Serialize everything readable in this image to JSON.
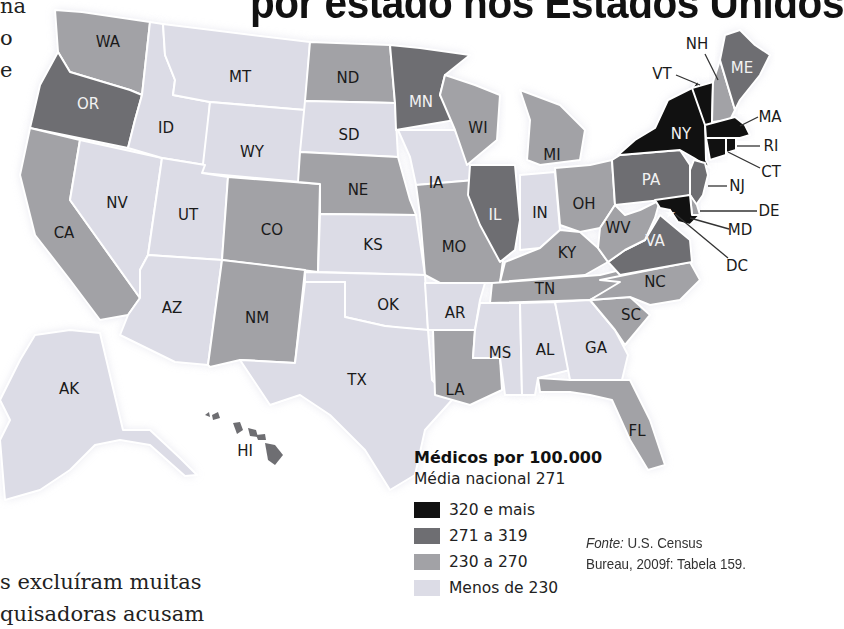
{
  "title": "por estado nos Estados Unidos",
  "side_text": {
    "top_fragments": [
      "na",
      "o",
      "e"
    ],
    "bottom_lines": [
      "s excluíram muitas",
      "quisadoras acusam"
    ]
  },
  "colors": {
    "cat_320_plus": "#111111",
    "cat_271_319": "#6e6e72",
    "cat_230_270": "#a2a2a6",
    "cat_below_230": "#dcdce6",
    "border": "#ffffff"
  },
  "legend": {
    "title": "Médicos por 100.000",
    "subtitle": "Média nacional 271",
    "items": [
      {
        "label": "320 e mais",
        "category": "cat_320_plus",
        "color": "#111111"
      },
      {
        "label": "271 a 319",
        "category": "cat_271_319",
        "color": "#6e6e72"
      },
      {
        "label": "230 a 270",
        "category": "cat_230_270",
        "color": "#a2a2a6"
      },
      {
        "label": "Menos de 230",
        "category": "cat_below_230",
        "color": "#dcdce6"
      }
    ]
  },
  "source": {
    "prefix": "Fonte:",
    "line1": " U.S. Census",
    "line2": "Bureau, 2009f: Tabela 159."
  },
  "chart_data": {
    "type": "choropleth",
    "national_average": 271,
    "bins": [
      "320 e mais",
      "271 a 319",
      "230 a 270",
      "Menos de 230"
    ],
    "states": {
      "WA": "230 a 270",
      "OR": "271 a 319",
      "CA": "230 a 270",
      "NV": "Menos de 230",
      "ID": "Menos de 230",
      "MT": "Menos de 230",
      "WY": "Menos de 230",
      "UT": "Menos de 230",
      "AZ": "Menos de 230",
      "CO": "230 a 270",
      "NM": "230 a 270",
      "ND": "230 a 270",
      "SD": "Menos de 230",
      "NE": "230 a 270",
      "KS": "Menos de 230",
      "OK": "Menos de 230",
      "TX": "Menos de 230",
      "MN": "271 a 319",
      "IA": "Menos de 230",
      "MO": "230 a 270",
      "AR": "Menos de 230",
      "LA": "230 a 270",
      "WI": "230 a 270",
      "IL": "271 a 319",
      "MI": "230 a 270",
      "IN": "Menos de 230",
      "OH": "230 a 270",
      "KY": "230 a 270",
      "TN": "230 a 270",
      "MS": "Menos de 230",
      "AL": "Menos de 230",
      "GA": "Menos de 230",
      "FL": "230 a 270",
      "SC": "230 a 270",
      "NC": "230 a 270",
      "VA": "271 a 319",
      "WV": "230 a 270",
      "PA": "271 a 319",
      "NY": "320 e mais",
      "VT": "320 e mais",
      "NH": "230 a 270",
      "ME": "271 a 319",
      "MA": "320 e mais",
      "RI": "320 e mais",
      "CT": "320 e mais",
      "NJ": "271 a 319",
      "DE": "230 a 270",
      "MD": "320 e mais",
      "DC": "320 e mais",
      "AK": "Menos de 230",
      "HI": "271 a 319"
    }
  },
  "states": [
    {
      "code": "WA",
      "cat": "cat_230_270",
      "pts": "55,10 82,12 150,22 142,95 130,90 70,72 58,52",
      "lx": 108,
      "ly": 42,
      "inv": false
    },
    {
      "code": "OR",
      "cat": "cat_271_319",
      "pts": "58,52 70,72 130,90 142,95 135,120 128,148 30,128 40,85",
      "lx": 88,
      "ly": 104,
      "inv": true
    },
    {
      "code": "CA",
      "cat": "cat_230_270",
      "pts": "30,128 80,140 70,200 140,298 128,315 100,320 70,280 35,235 20,175",
      "lx": 64,
      "ly": 233,
      "inv": false
    },
    {
      "code": "NV",
      "cat": "cat_below_230",
      "pts": "80,140 162,158 148,255 140,270 140,298 70,200",
      "lx": 117,
      "ly": 203,
      "inv": false
    },
    {
      "code": "ID",
      "cat": "cat_below_230",
      "pts": "150,22 163,24 165,55 175,80 173,95 210,102 205,165 162,158 128,148 135,120 142,95",
      "lx": 166,
      "ly": 128,
      "inv": false
    },
    {
      "code": "MT",
      "cat": "cat_below_230",
      "pts": "163,24 310,42 305,110 210,102 173,95 175,80 165,55",
      "lx": 240,
      "ly": 77,
      "inv": false
    },
    {
      "code": "WY",
      "cat": "cat_below_230",
      "pts": "210,102 305,110 300,182 202,173",
      "lx": 252,
      "ly": 152,
      "inv": false
    },
    {
      "code": "UT",
      "cat": "cat_below_230",
      "pts": "162,158 205,165 202,173 228,177 222,260 148,255",
      "lx": 188,
      "ly": 215,
      "inv": false
    },
    {
      "code": "AZ",
      "cat": "cat_below_230",
      "pts": "148,255 222,260 208,365 175,362 120,335 128,315 140,298 140,270",
      "lx": 172,
      "ly": 308,
      "inv": false
    },
    {
      "code": "CO",
      "cat": "cat_230_270",
      "pts": "228,177 320,184 318,272 222,260",
      "lx": 272,
      "ly": 230,
      "inv": false
    },
    {
      "code": "NM",
      "cat": "cat_230_270",
      "pts": "222,260 305,270 295,363 240,360 210,367 208,365",
      "lx": 257,
      "ly": 318,
      "inv": false
    },
    {
      "code": "ND",
      "cat": "cat_230_270",
      "pts": "310,42 390,45 395,103 305,101",
      "lx": 348,
      "ly": 78,
      "inv": false
    },
    {
      "code": "SD",
      "cat": "cat_below_230",
      "pts": "305,101 395,103 398,157 300,152",
      "lx": 349,
      "ly": 135,
      "inv": false
    },
    {
      "code": "NE",
      "cat": "cat_230_270",
      "pts": "300,152 398,157 410,200 416,215 320,214 320,184 298,182",
      "lx": 358,
      "ly": 190,
      "inv": false
    },
    {
      "code": "KS",
      "cat": "cat_below_230",
      "pts": "320,214 416,215 425,275 318,272",
      "lx": 373,
      "ly": 245,
      "inv": false
    },
    {
      "code": "OK",
      "cat": "cat_below_230",
      "pts": "305,272 425,275 428,330 400,328 385,326 345,317 345,282 305,282",
      "lx": 388,
      "ly": 305,
      "inv": false
    },
    {
      "code": "TX",
      "cat": "cat_below_230",
      "pts": "305,282 345,282 345,317 385,326 428,330 432,380 452,400 425,430 415,475 390,490 365,450 330,415 300,395 270,405 240,360 295,363",
      "lx": 357,
      "ly": 380,
      "inv": false
    },
    {
      "code": "MN",
      "cat": "cat_271_319",
      "pts": "390,45 420,48 470,55 445,75 440,95 455,120 396,130 395,103",
      "lx": 421,
      "ly": 102,
      "inv": true
    },
    {
      "code": "IA",
      "cat": "cat_below_230",
      "pts": "398,130 455,130 468,160 475,180 416,185 410,157",
      "lx": 436,
      "ly": 183,
      "inv": false
    },
    {
      "code": "MO",
      "cat": "cat_230_270",
      "pts": "416,185 475,180 485,215 505,245 500,283 440,283 425,275 420,215",
      "lx": 454,
      "ly": 247,
      "inv": false
    },
    {
      "code": "AR",
      "cat": "cat_below_230",
      "pts": "425,283 485,283 480,300 475,330 433,330 428,330",
      "lx": 455,
      "ly": 313,
      "inv": false
    },
    {
      "code": "LA",
      "cat": "cat_230_270",
      "pts": "433,330 475,330 473,358 500,358 502,390 470,405 435,395",
      "lx": 455,
      "ly": 390,
      "inv": false
    },
    {
      "code": "WI",
      "cat": "cat_230_270",
      "pts": "445,75 475,85 500,95 497,140 467,165 455,130 440,95",
      "lx": 478,
      "ly": 128,
      "inv": false
    },
    {
      "code": "IL",
      "cat": "cat_271_319",
      "pts": "470,165 515,165 520,220 515,250 500,262 480,225 468,195",
      "lx": 495,
      "ly": 215,
      "inv": true
    },
    {
      "code": "MI",
      "cat": "cat_230_270",
      "pts": "520,90 560,105 585,130 580,160 540,165 527,160 530,120",
      "lx": 552,
      "ly": 155,
      "inv": false
    },
    {
      "code": "IN",
      "cat": "cat_below_230",
      "pts": "520,175 555,172 560,230 540,248 520,250",
      "lx": 540,
      "ly": 213,
      "inv": false
    },
    {
      "code": "OH",
      "cat": "cat_230_270",
      "pts": "555,168 590,165 612,160 615,205 600,228 580,232 560,225",
      "lx": 584,
      "ly": 204,
      "inv": false
    },
    {
      "code": "KY",
      "cat": "cat_230_270",
      "pts": "505,262 540,248 560,230 580,232 598,248 608,262 585,275 500,282",
      "lx": 567,
      "ly": 253,
      "inv": false
    },
    {
      "code": "TN",
      "cat": "cat_230_270",
      "pts": "492,283 600,275 620,270 625,282 590,300 490,303",
      "lx": 545,
      "ly": 289,
      "inv": false
    },
    {
      "code": "MS",
      "cat": "cat_below_230",
      "pts": "480,303 520,303 522,395 505,395 500,358 473,358 475,330",
      "lx": 500,
      "ly": 353,
      "inv": false
    },
    {
      "code": "AL",
      "cat": "cat_below_230",
      "pts": "520,303 555,302 570,370 538,378 535,395 522,395",
      "lx": 545,
      "ly": 350,
      "inv": false
    },
    {
      "code": "GA",
      "cat": "cat_below_230",
      "pts": "555,302 590,300 615,330 628,355 622,380 570,380",
      "lx": 596,
      "ly": 348,
      "inv": false
    },
    {
      "code": "FL",
      "cat": "cat_230_270",
      "pts": "538,378 570,380 622,380 630,380 650,420 665,465 648,470 630,440 612,400 590,395 570,392 540,392",
      "lx": 637,
      "ly": 431,
      "inv": false
    },
    {
      "code": "SC",
      "cat": "cat_230_270",
      "pts": "590,300 630,297 650,315 625,345 615,330",
      "lx": 631,
      "ly": 315,
      "inv": false
    },
    {
      "code": "NC",
      "cat": "cat_230_270",
      "pts": "600,280 690,262 700,280 680,300 650,305 630,297 590,300 620,282",
      "lx": 655,
      "ly": 282,
      "inv": false
    },
    {
      "code": "VA",
      "cat": "cat_271_319",
      "pts": "608,262 625,250 645,240 660,215 678,230 690,240 692,262 620,275",
      "lx": 655,
      "ly": 241,
      "inv": true
    },
    {
      "code": "WV",
      "cat": "cat_230_270",
      "pts": "598,248 600,228 615,205 625,215 640,210 660,200 655,218 645,240 625,250 608,262",
      "lx": 618,
      "ly": 228,
      "inv": false
    },
    {
      "code": "PA",
      "cat": "cat_271_319",
      "pts": "612,160 620,155 680,150 690,165 690,195 680,198 615,205",
      "lx": 651,
      "ly": 180,
      "inv": true
    },
    {
      "code": "NY",
      "cat": "cat_320_plus",
      "pts": "618,155 635,140 655,128 668,100 692,88 698,80 705,120 706,160 710,168 694,158 680,150 620,155",
      "lx": 681,
      "ly": 134,
      "inv": true
    },
    {
      "code": "VT",
      "cat": "cat_320_plus",
      "pts": "692,88 713,82 712,125 705,125",
      "lx": 706,
      "ly": 105,
      "inv": false
    },
    {
      "code": "NH",
      "cat": "cat_230_270",
      "pts": "713,82 720,60 735,110 730,120 712,122",
      "lx": 722,
      "ly": 100,
      "inv": false
    },
    {
      "code": "ME",
      "cat": "cat_271_319",
      "pts": "720,60 725,35 740,30 755,45 770,55 760,75 740,100 735,110",
      "lx": 742,
      "ly": 68,
      "inv": true
    },
    {
      "code": "MA",
      "cat": "cat_320_plus",
      "pts": "705,125 735,117 745,125 750,135 740,138 706,138",
      "lx": 725,
      "ly": 130,
      "inv": false
    },
    {
      "code": "CT",
      "cat": "cat_320_plus",
      "pts": "706,138 726,138 726,155 710,160",
      "lx": 716,
      "ly": 148,
      "inv": false
    },
    {
      "code": "RI",
      "cat": "cat_320_plus",
      "pts": "726,138 736,138 736,150 726,153",
      "lx": 731,
      "ly": 145,
      "inv": false
    },
    {
      "code": "NJ",
      "cat": "cat_271_319",
      "pts": "694,160 705,163 708,175 703,195 696,205 690,195 690,170",
      "lx": 699,
      "ly": 182,
      "inv": false
    },
    {
      "code": "DE",
      "cat": "cat_230_270",
      "pts": "690,195 697,205 700,215 692,215",
      "lx": 694,
      "ly": 207,
      "inv": false
    },
    {
      "code": "MD",
      "cat": "cat_320_plus",
      "pts": "655,200 690,195 692,215 700,215 690,225 678,222 670,210 660,208",
      "lx": 680,
      "ly": 209,
      "inv": false
    },
    {
      "code": "AK",
      "cat": "cat_below_230",
      "pts": "35,335 70,330 100,333 123,430 150,430 180,458 197,475 185,476 150,445 120,440 95,445 70,470 40,490 5,500 0,440 10,420 0,400 20,360",
      "lx": 69,
      "ly": 389,
      "inv": false
    }
  ],
  "hawaii": {
    "code": "HI",
    "cat": "cat_271_319",
    "islands": [
      "205,415 209,412 210,417",
      "212,415 218,412 220,418 213,420",
      "233,423 240,422 243,430 237,434",
      "248,428 256,430 258,437 250,436",
      "256,435 265,434 266,440 258,440",
      "265,443 275,445 283,455 275,465 268,460"
    ],
    "lx": 245,
    "ly": 451
  },
  "callouts": [
    {
      "code": "NH",
      "tx": 697,
      "ty": 44,
      "x1": 705,
      "y1": 54,
      "x2": 718,
      "y2": 80
    },
    {
      "code": "VT",
      "tx": 662,
      "ty": 74,
      "x1": 676,
      "y1": 75,
      "x2": 700,
      "y2": 85
    },
    {
      "code": "MA",
      "tx": 770,
      "ty": 117,
      "x1": 758,
      "y1": 117,
      "x2": 740,
      "y2": 126
    },
    {
      "code": "RI",
      "tx": 771,
      "ty": 146,
      "x1": 760,
      "y1": 146,
      "x2": 737,
      "y2": 146
    },
    {
      "code": "CT",
      "tx": 771,
      "ty": 172,
      "x1": 760,
      "y1": 168,
      "x2": 728,
      "y2": 152
    },
    {
      "code": "NJ",
      "tx": 737,
      "ty": 186,
      "x1": 727,
      "y1": 186,
      "x2": 708,
      "y2": 186
    },
    {
      "code": "DE",
      "tx": 769,
      "ty": 211,
      "x1": 757,
      "y1": 211,
      "x2": 700,
      "y2": 211
    },
    {
      "code": "MD",
      "tx": 740,
      "ty": 230,
      "x1": 729,
      "y1": 229,
      "x2": 690,
      "y2": 218
    },
    {
      "code": "DC",
      "tx": 737,
      "ty": 266,
      "x1": 728,
      "y1": 258,
      "x2": 675,
      "y2": 214
    }
  ]
}
